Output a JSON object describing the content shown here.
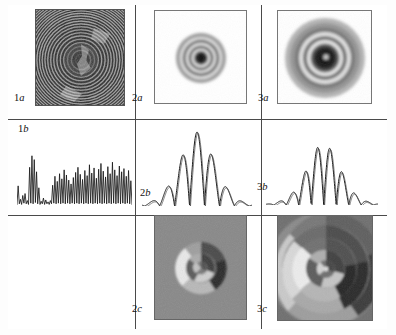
{
  "figure": {
    "title": "",
    "layout": {
      "rows": 3,
      "cols": 3,
      "empty_cells": [
        "1c"
      ]
    },
    "row_kinds": [
      "intensity-image",
      "profile-plot",
      "phase-image"
    ]
  },
  "panels": [
    {
      "id": "1a",
      "label_num": "1",
      "label_let": "a",
      "kind": "intensity-image",
      "description": "dense high-frequency concentric rings filling square, speckle noise, dark central disc"
    },
    {
      "id": "2a",
      "label_num": "2",
      "label_let": "a",
      "kind": "intensity-image",
      "description": "small compact concentric ring pattern, dark core, three bright rings, white surround"
    },
    {
      "id": "3a",
      "label_num": "3",
      "label_let": "a",
      "kind": "intensity-image",
      "description": "large concentric ring pattern, dark core with bright speck, four rings, soft edge"
    },
    {
      "id": "1b",
      "label_num": "1",
      "label_let": "b",
      "kind": "profile-plot",
      "description": "noisy chaotic high-frequency oscillating trace"
    },
    {
      "id": "2b",
      "label_num": "2",
      "label_let": "b",
      "kind": "profile-plot",
      "description": "clean oscillation under bell envelope, six peaks, tallest at centre"
    },
    {
      "id": "3b",
      "label_num": "3",
      "label_let": "b",
      "kind": "profile-plot",
      "description": "clean oscillation under wider bell envelope, seven peaks, double-line trace"
    },
    {
      "id": "2c",
      "label_num": "2",
      "label_let": "c",
      "kind": "phase-image",
      "description": "spiral pinwheel phase map on mid-grey field, bright and dark crescents"
    },
    {
      "id": "3c",
      "label_num": "3",
      "label_let": "c",
      "kind": "phase-image",
      "description": "large spiral phase map, concentric annuli with bright right crescent and dark left crescent"
    }
  ],
  "chart_data": [
    {
      "id": "1b",
      "type": "line",
      "title": "",
      "xlabel": "",
      "ylabel": "",
      "xlim": [
        0,
        1
      ],
      "ylim": [
        0,
        1
      ],
      "grid": false,
      "legend": "none",
      "x": [
        0.0,
        0.01,
        0.02,
        0.03,
        0.04,
        0.05,
        0.06,
        0.07,
        0.08,
        0.09,
        0.1,
        0.11,
        0.12,
        0.13,
        0.14,
        0.15,
        0.16,
        0.17,
        0.18,
        0.19,
        0.2,
        0.21,
        0.22,
        0.23,
        0.24,
        0.25,
        0.26,
        0.27,
        0.28,
        0.29,
        0.3,
        0.31,
        0.32,
        0.33,
        0.34,
        0.35,
        0.36,
        0.37,
        0.38,
        0.39,
        0.4,
        0.41,
        0.42,
        0.43,
        0.44,
        0.45,
        0.46,
        0.47,
        0.48,
        0.49,
        0.5,
        0.51,
        0.52,
        0.53,
        0.54,
        0.55,
        0.56,
        0.57,
        0.58,
        0.59,
        0.6,
        0.61,
        0.62,
        0.63,
        0.64,
        0.65,
        0.66,
        0.67,
        0.68,
        0.69,
        0.7,
        0.71,
        0.72,
        0.73,
        0.74,
        0.75,
        0.76,
        0.77,
        0.78,
        0.79,
        0.8,
        0.81,
        0.82,
        0.83,
        0.84,
        0.85,
        0.86,
        0.87,
        0.88,
        0.89,
        0.9,
        0.91,
        0.92,
        0.93,
        0.94,
        0.95,
        0.96,
        0.97,
        0.98,
        0.99,
        1.0
      ],
      "values": [
        0.04,
        0.33,
        0.05,
        0.12,
        0.04,
        0.18,
        0.06,
        0.21,
        0.05,
        0.1,
        0.04,
        0.62,
        0.06,
        0.8,
        0.05,
        0.74,
        0.07,
        0.55,
        0.05,
        0.3,
        0.04,
        0.09,
        0.05,
        0.14,
        0.04,
        0.11,
        0.05,
        0.08,
        0.04,
        0.1,
        0.05,
        0.34,
        0.06,
        0.48,
        0.05,
        0.4,
        0.06,
        0.52,
        0.05,
        0.44,
        0.06,
        0.58,
        0.05,
        0.5,
        0.06,
        0.42,
        0.05,
        0.36,
        0.06,
        0.46,
        0.05,
        0.54,
        0.06,
        0.62,
        0.05,
        0.51,
        0.06,
        0.43,
        0.05,
        0.57,
        0.06,
        0.49,
        0.05,
        0.66,
        0.06,
        0.53,
        0.05,
        0.61,
        0.06,
        0.45,
        0.05,
        0.59,
        0.06,
        0.68,
        0.05,
        0.56,
        0.06,
        0.47,
        0.05,
        0.63,
        0.06,
        0.52,
        0.05,
        0.7,
        0.06,
        0.58,
        0.05,
        0.49,
        0.06,
        0.64,
        0.05,
        0.55,
        0.06,
        0.6,
        0.05,
        0.48,
        0.06,
        0.57,
        0.05,
        0.41,
        0.04
      ]
    },
    {
      "id": "2b",
      "type": "line",
      "title": "",
      "xlabel": "",
      "ylabel": "",
      "xlim": [
        0,
        1
      ],
      "ylim": [
        0,
        1
      ],
      "grid": false,
      "legend": "none",
      "envelope": "gaussian",
      "peak_count": 6,
      "peak_positions": [
        0.16,
        0.3,
        0.43,
        0.57,
        0.7,
        0.84
      ],
      "peak_values": [
        0.62,
        0.74,
        0.96,
        1.0,
        0.72,
        0.6
      ]
    },
    {
      "id": "3b",
      "type": "line",
      "title": "",
      "xlabel": "",
      "ylabel": "",
      "xlim": [
        0,
        1
      ],
      "ylim": [
        0,
        1
      ],
      "grid": false,
      "legend": "none",
      "envelope": "gaussian",
      "peak_count": 7,
      "peak_positions": [
        0.18,
        0.3,
        0.41,
        0.52,
        0.63,
        0.74,
        0.85
      ],
      "peak_values": [
        0.5,
        0.62,
        0.9,
        0.94,
        0.86,
        0.58,
        0.46
      ]
    }
  ],
  "colors": {
    "frame": "#3a3a3a",
    "grid_line": "#4a4a4a",
    "trace": "#1a1a1a",
    "panel_border": "#777777",
    "background": "#ffffff",
    "phase_field": "#8a8a8a"
  }
}
